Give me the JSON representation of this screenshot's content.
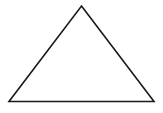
{
  "canvas": {
    "width": 163,
    "height": 113,
    "background_color": "#ffffff"
  },
  "figure": {
    "name": "triangle",
    "shape_type": "triangle",
    "classification": "isosceles",
    "fill": "none",
    "fill_color": "#ffffff",
    "stroke_color": "#1a1a1a",
    "stroke_width": 1.6,
    "label": "",
    "vertices": [
      {
        "name": "apex",
        "x": 81.5,
        "y": 6
      },
      {
        "name": "bottom-right",
        "x": 154,
        "y": 101.5
      },
      {
        "name": "bottom-left",
        "x": 9,
        "y": 101.5
      }
    ],
    "points_attr": "81.5,6 154,101.5 9,101.5",
    "base_width": 145,
    "height": 95.5
  }
}
